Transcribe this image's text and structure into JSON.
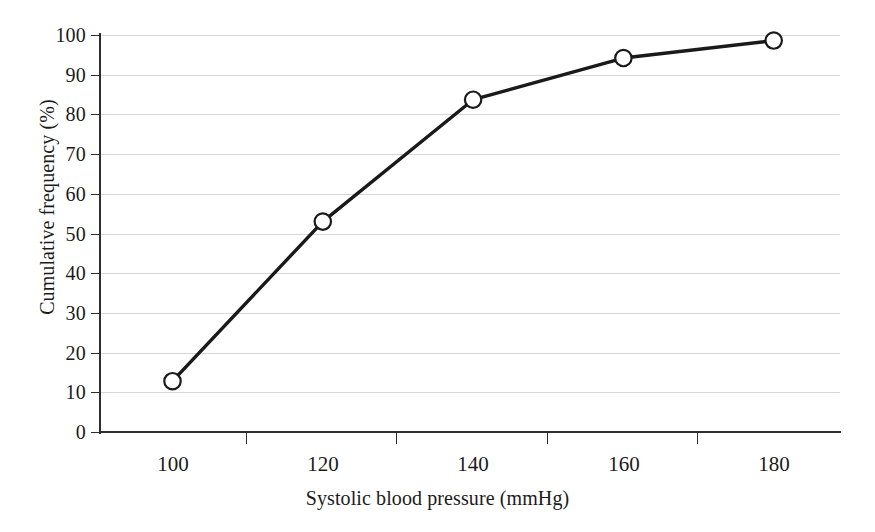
{
  "chart_data": {
    "type": "line",
    "title": "",
    "subtitle": "",
    "xlabel": "Systolic blood pressure (mmHg)",
    "ylabel": "Cumulative frequency (%)",
    "x": [
      100,
      120,
      140,
      160,
      180
    ],
    "xtick_labels": [
      "100",
      "120",
      "140",
      "160",
      "180"
    ],
    "ytick_labels": [
      "0",
      "10",
      "20",
      "30",
      "40",
      "50",
      "60",
      "70",
      "80",
      "90",
      "100"
    ],
    "yticks": [
      0,
      10,
      20,
      30,
      40,
      50,
      60,
      70,
      80,
      90,
      100
    ],
    "values": [
      12.8,
      53.0,
      83.7,
      94.2,
      98.6
    ],
    "series": [
      {
        "name": "Cumulative frequency",
        "values": [
          12.8,
          53.0,
          83.7,
          94.2,
          98.6
        ]
      }
    ],
    "xlim": [
      90,
      190
    ],
    "ylim": [
      0,
      100
    ],
    "grid": "horizontal",
    "legend": "none",
    "marker": "open-circle",
    "line_color": "#1a1a1a",
    "marker_fill": "#ffffff",
    "grid_color": "#b9bfcc",
    "axis_color": "#2e2e2e",
    "background": "#ffffff"
  }
}
